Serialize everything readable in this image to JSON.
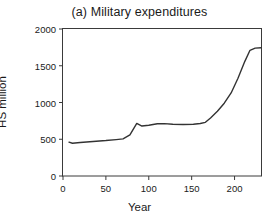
{
  "chart_data": {
    "type": "line",
    "title": "(a) Military expenditures",
    "xlabel": "Year",
    "ylabel": "HS million",
    "xlim": [
      0,
      232
    ],
    "ylim": [
      0,
      2000
    ],
    "xticks": [
      0,
      50,
      100,
      150,
      200
    ],
    "yticks": [
      0,
      500,
      1000,
      1500,
      2000
    ],
    "xtick_labels": [
      "0",
      "50",
      "100",
      "150",
      "200"
    ],
    "ytick_labels": [
      "0",
      "500",
      "1000",
      "1500",
      "2000"
    ],
    "grid": false,
    "legend": "none",
    "series": [
      {
        "name": "Military expenditures",
        "color": "#333333",
        "x": [
          7,
          11,
          20,
          35,
          50,
          62,
          70,
          78,
          86,
          92,
          100,
          110,
          118,
          128,
          140,
          152,
          160,
          166,
          172,
          180,
          188,
          196,
          204,
          212,
          218,
          224,
          231
        ],
        "y": [
          460,
          445,
          455,
          470,
          482,
          495,
          505,
          560,
          715,
          680,
          690,
          710,
          712,
          705,
          700,
          705,
          715,
          730,
          790,
          880,
          990,
          1130,
          1330,
          1560,
          1710,
          1740,
          1745
        ]
      }
    ]
  }
}
